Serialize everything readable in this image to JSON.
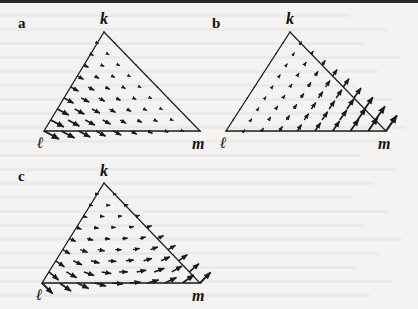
{
  "figure": {
    "top_rule": true,
    "ink_color": "#1a1a1a",
    "panels": [
      {
        "id": "a",
        "label": "a",
        "label_pos": [
          18,
          28
        ],
        "vertices": {
          "k": {
            "label": "k",
            "xy": [
              104,
              32
            ],
            "label_xy": [
              100,
              24
            ]
          },
          "l": {
            "label": "ℓ",
            "xy": [
              44,
              131
            ],
            "label_xy": [
              37,
              148
            ]
          },
          "m": {
            "label": "m",
            "xy": [
              200,
              131
            ],
            "label_xy": [
              192,
              149
            ]
          }
        },
        "field": {
          "description": "flow directed down-right (toward m / away from l-k edge); magnitude largest near l, vanishing near k-m edge",
          "direction_deg": 28,
          "pattern": "a"
        }
      },
      {
        "id": "b",
        "label": "b",
        "label_pos": [
          212,
          28
        ],
        "vertices": {
          "k": {
            "label": "k",
            "xy": [
              290,
              32
            ],
            "label_xy": [
              286,
              24
            ]
          },
          "l": {
            "label": "ℓ",
            "xy": [
              226,
              131
            ],
            "label_xy": [
              220,
              148
            ]
          },
          "m": {
            "label": "m",
            "xy": [
              386,
              131
            ],
            "label_xy": [
              378,
              149
            ]
          }
        },
        "field": {
          "description": "flow directed up-right (outward through k-m edge); magnitude largest near m, vanishing near l-k edge",
          "direction_deg": -55,
          "pattern": "b"
        }
      },
      {
        "id": "c",
        "label": "c",
        "label_pos": [
          18,
          181
        ],
        "vertices": {
          "k": {
            "label": "k",
            "xy": [
              104,
              183
            ],
            "label_xy": [
              100,
              176
            ]
          },
          "l": {
            "label": "ℓ",
            "xy": [
              42,
              283
            ],
            "label_xy": [
              36,
              300
            ]
          },
          "m": {
            "label": "m",
            "xy": [
              200,
              283
            ],
            "label_xy": [
              192,
              301
            ]
          }
        },
        "field": {
          "description": "combined curved flow: down-right near l, horizontal through the interior, turning up-right near m; small near k",
          "pattern": "c"
        }
      }
    ]
  },
  "background_text_lines": 21
}
